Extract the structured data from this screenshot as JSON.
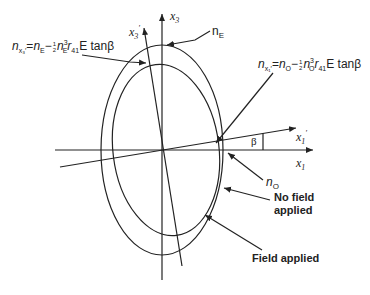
{
  "diagram": {
    "type": "index-ellipse",
    "axes": {
      "x1": "x",
      "x1_sub": "1",
      "x3": "x",
      "x3_sub": "3",
      "x1_prime": "x",
      "x1_prime_sub": "1",
      "x3_prime": "x",
      "x3_prime_sub": "3",
      "prime": "′"
    },
    "angle_label": "β",
    "labels": {
      "nE": "n",
      "nE_sub": "E",
      "nO": "n",
      "nO_sub": "O",
      "no_field": "No field applied",
      "no_field_line1": "No field",
      "no_field_line2": "applied",
      "field_applied": "Field applied"
    },
    "equations": {
      "x3_prime": {
        "lhs": "n",
        "lhs_sub": "x₃′",
        "eq": "=",
        "n": "n",
        "n_sub": "E",
        "minus": "−",
        "frac_num": "1",
        "frac_den": "2",
        "n2": "n",
        "n2_sup": "3",
        "n2_sub": "E",
        "r": "r",
        "r_sub": "41",
        "tail": "E tanβ"
      },
      "x1_prime": {
        "lhs": "n",
        "lhs_sub": "x₁′",
        "eq": "=",
        "n": "n",
        "n_sub": "O",
        "minus": "−",
        "frac_num": "1",
        "frac_den": "2",
        "n2": "n",
        "n2_sup": "3",
        "n2_sub": "O",
        "r": "r",
        "r_sub": "41",
        "tail": "E tanβ"
      }
    },
    "colors": {
      "line": "#222222",
      "background": "#ffffff"
    }
  }
}
